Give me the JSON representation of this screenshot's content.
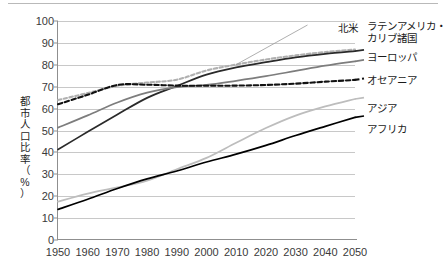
{
  "chart_data": {
    "type": "line",
    "title": "",
    "xlabel": "",
    "ylabel": "都市人口比率（%）",
    "ylabel_chars": [
      "都",
      "市",
      "人",
      "口",
      "比",
      "率",
      "（",
      "%",
      "）"
    ],
    "x": [
      1950,
      1960,
      1970,
      1980,
      1990,
      2000,
      2010,
      2020,
      2030,
      2040,
      2050
    ],
    "xlim": [
      1950,
      2050
    ],
    "ylim": [
      0,
      100
    ],
    "yticks": [
      0,
      10,
      20,
      30,
      40,
      50,
      60,
      70,
      80,
      90,
      100
    ],
    "xticks": [
      "1950",
      "1960",
      "1970",
      "1980",
      "1990",
      "2000",
      "2010",
      "2020",
      "2030",
      "2040",
      "2050"
    ],
    "grid": "horizontal",
    "legend_position": "right-of-plot-inline-labels",
    "series": [
      {
        "name": "北米",
        "label": "北米",
        "style": "dashed",
        "color": "#b0b0b0",
        "callout": true,
        "values": [
          63.9,
          67.1,
          70.4,
          71.9,
          73.2,
          77.4,
          80.1,
          82.4,
          84.3,
          85.8,
          87.0
        ]
      },
      {
        "name": "ラテンアメリカ・カリブ諸国",
        "label": "ラテンアメリカ・カリブ諸国",
        "style": "solid",
        "color": "#2a2a2a",
        "values": [
          41.3,
          49.4,
          57.3,
          64.9,
          70.3,
          75.5,
          78.8,
          81.2,
          83.4,
          85.0,
          86.2
        ]
      },
      {
        "name": "ヨーロッパ",
        "label": "ヨーロッパ",
        "style": "solid",
        "color": "#7d7d7d",
        "values": [
          51.3,
          56.9,
          62.8,
          67.3,
          69.8,
          70.8,
          72.7,
          74.8,
          77.2,
          79.6,
          81.6
        ]
      },
      {
        "name": "オセアニア",
        "label": "オセアニア",
        "style": "dashed",
        "color": "#111111",
        "values": [
          62.0,
          66.3,
          70.8,
          70.9,
          70.5,
          70.4,
          70.5,
          70.8,
          71.4,
          72.3,
          73.1
        ]
      },
      {
        "name": "アジア",
        "label": "アジア",
        "style": "solid",
        "color": "#bdbdbd",
        "values": [
          17.5,
          21.2,
          24.0,
          27.1,
          32.3,
          37.5,
          44.4,
          51.1,
          56.8,
          61.0,
          64.4
        ]
      },
      {
        "name": "アフリカ",
        "label": "アフリカ",
        "style": "solid",
        "color": "#000000",
        "values": [
          14.0,
          18.6,
          23.5,
          27.9,
          31.5,
          35.6,
          39.2,
          43.2,
          47.7,
          51.9,
          56.0
        ]
      }
    ]
  },
  "axis": {
    "y_ticks": [
      "100",
      "90",
      "80",
      "70",
      "60",
      "50",
      "40",
      "30",
      "20",
      "10",
      "0"
    ],
    "x_ticks": [
      "1950",
      "1960",
      "1970",
      "1980",
      "1990",
      "2000",
      "2010",
      "2020",
      "2030",
      "2040",
      "2050"
    ]
  },
  "labels": {
    "north_america": "北米",
    "latin_america_line1": "ラテンアメリカ・",
    "latin_america_line2": "カリブ諸国",
    "europe": "ヨーロッパ",
    "oceania": "オセアニア",
    "asia": "アジア",
    "africa": "アフリカ",
    "ylabel": "都市人口比率（%）"
  },
  "colors": {
    "grid": "#c8c8c8",
    "axis": "#8f8f8f",
    "text": "#1f1f1f",
    "north_america": "#b0b0b0",
    "latin_america": "#2a2a2a",
    "europe": "#7d7d7d",
    "oceania": "#111111",
    "asia": "#bdbdbd",
    "africa": "#000000"
  }
}
